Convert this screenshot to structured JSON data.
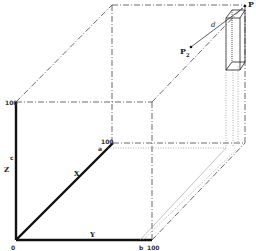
{
  "diagram": {
    "axes": {
      "x": {
        "label": "X",
        "max_label": "100",
        "tick_label": "a"
      },
      "y": {
        "label": "Y",
        "max_label": "100",
        "tick_label": "b"
      },
      "z": {
        "label": "Z",
        "max_label": "100",
        "tick_label": "c"
      },
      "origin_label": "0"
    },
    "points": {
      "p": {
        "label": "P"
      },
      "p2": {
        "label": "P",
        "subscript": "2"
      }
    },
    "distance_label": "d",
    "colors": {
      "axis": "#111111",
      "dashed": "#444444",
      "dotted": "#777777"
    }
  }
}
